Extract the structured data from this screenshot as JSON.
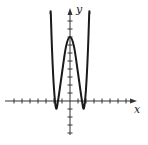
{
  "chart_data": {
    "type": "line",
    "title": "",
    "xlabel": "x",
    "ylabel": "y",
    "grid": false,
    "legend": null,
    "axis_style": "cross-through-origin with tick marks, arrowheads on positive x and y",
    "x_ticks_count": {
      "negative": 7,
      "positive": 7
    },
    "y_ticks_count": {
      "positive": 10,
      "negative": 4
    },
    "tick_unit_px": 8,
    "xlim": [
      -8,
      8
    ],
    "ylim": [
      -4,
      11
    ],
    "series": [
      {
        "name": "quartic-like curve (W shape)",
        "description": "Even function: local maximum on y-axis at about y=8, two local minima slightly below x-axis near x=±1.75 (y≈-1), steep outer branches rising past the top of the window near x=±2.4",
        "x": [
          -2.4,
          -2.25,
          -2.0,
          -1.75,
          -1.5,
          -1.0,
          -0.5,
          0,
          0.5,
          1.0,
          1.5,
          1.75,
          2.0,
          2.25,
          2.4
        ],
        "y": [
          10.9,
          6.5,
          1.5,
          -0.9,
          0.0,
          3.5,
          6.8,
          8.0,
          6.8,
          3.5,
          0.0,
          -0.9,
          1.5,
          6.5,
          10.9
        ]
      }
    ],
    "annotations": []
  },
  "labels": {
    "x_axis": "x",
    "y_axis": "y"
  },
  "colors": {
    "curve": "#1a1a1a",
    "axes": "#333333",
    "background": "#ffffff"
  }
}
